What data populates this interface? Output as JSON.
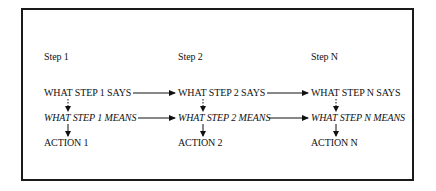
{
  "diagram": {
    "columns": [
      {
        "step": "Step 1",
        "says": "WHAT STEP 1 SAYS",
        "means": "WHAT STEP 1 MEANS",
        "action": "ACTION 1"
      },
      {
        "step": "Step 2",
        "says": "WHAT STEP 2 SAYS",
        "means": "WHAT STEP 2 MEANS",
        "action": "ACTION 2"
      },
      {
        "step": "Step N",
        "says": "WHAT STEP N SAYS",
        "means": "WHAT STEP N MEANS",
        "action": "ACTION N"
      }
    ],
    "arrows": {
      "horizontal": "solid arrows link SAYS to next SAYS and MEANS to next MEANS",
      "says_to_means": "dotted",
      "means_to_action": "solid"
    },
    "colors": {
      "ink": "#111111",
      "frame": "#1a1a1a",
      "background": "#ffffff"
    }
  }
}
